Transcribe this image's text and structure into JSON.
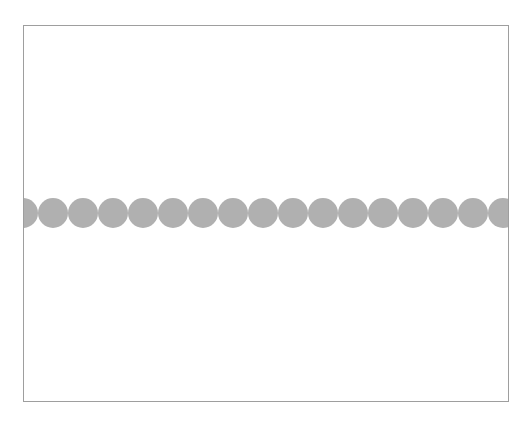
{
  "canvas": {
    "frame_color": "#9e9e9e",
    "background": "#ffffff"
  },
  "dots": {
    "count": 17,
    "color": "#b0b0b0"
  }
}
